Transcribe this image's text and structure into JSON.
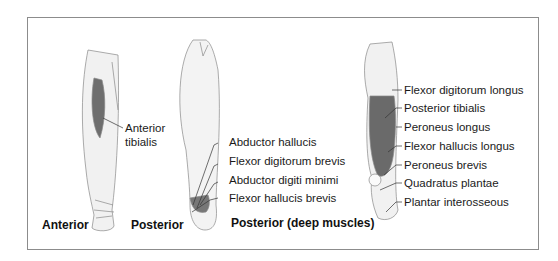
{
  "figure": {
    "views": [
      {
        "caption": "Anterior",
        "labels": [
          "Anterior",
          "tibialis"
        ]
      },
      {
        "caption": "Posterior",
        "labels": [
          "Abductor hallucis",
          "Flexor digitorum brevis",
          "Abductor digiti minimi",
          "Flexor hallucis brevis"
        ]
      },
      {
        "caption": "Posterior (deep muscles)",
        "labels": [
          "Flexor digitorum longus",
          "Posterior tibialis",
          "Peroneus longus",
          "Flexor hallucis longus",
          "Peroneus brevis",
          "Quadratus plantae",
          "Plantar interosseous"
        ]
      }
    ]
  }
}
